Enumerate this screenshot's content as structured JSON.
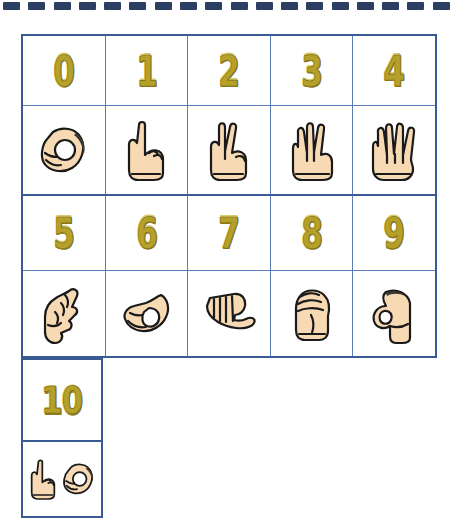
{
  "page": {
    "background_color": "#ffffff"
  },
  "binding": {
    "name": "spiral-binding-dashes",
    "dash_color": "#2c3e62",
    "dash_count": 18
  },
  "colors": {
    "grid_border_outer": "#3a5a94",
    "grid_border_inner": "#5b7cb5",
    "number_fill": "#b5a02a",
    "number_outline": "#7d6d18",
    "skin_fill": "#f7d9b4",
    "skin_outline": "#1a1a1a"
  },
  "chart": {
    "rows": [
      {
        "type": "numbers",
        "cells": [
          {
            "label": "0",
            "name": "number-0"
          },
          {
            "label": "1",
            "name": "number-1"
          },
          {
            "label": "2",
            "name": "number-2"
          },
          {
            "label": "3",
            "name": "number-3"
          },
          {
            "label": "4",
            "name": "number-4"
          }
        ]
      },
      {
        "type": "hands",
        "cells": [
          {
            "sign": "asl-hand-0",
            "alt": "Hand sign for 0 - fingers and thumb form an O"
          },
          {
            "sign": "asl-hand-1",
            "alt": "Hand sign for 1 - index finger up"
          },
          {
            "sign": "asl-hand-2",
            "alt": "Hand sign for 2 - index and middle finger up"
          },
          {
            "sign": "asl-hand-3",
            "alt": "Hand sign for 3 - thumb, index and middle up"
          },
          {
            "sign": "asl-hand-4",
            "alt": "Hand sign for 4 - four fingers up"
          }
        ]
      },
      {
        "type": "numbers",
        "cells": [
          {
            "label": "5",
            "name": "number-5"
          },
          {
            "label": "6",
            "name": "number-6"
          },
          {
            "label": "7",
            "name": "number-7"
          },
          {
            "label": "8",
            "name": "number-8"
          },
          {
            "label": "9",
            "name": "number-9"
          }
        ]
      },
      {
        "type": "hands",
        "cells": [
          {
            "sign": "asl-hand-5",
            "alt": "Hand sign for 5 - pinky touching thumb"
          },
          {
            "sign": "asl-hand-6",
            "alt": "Hand sign for 6 - ring finger touching thumb"
          },
          {
            "sign": "asl-hand-7",
            "alt": "Hand sign for 7 - middle finger touching thumb"
          },
          {
            "sign": "asl-hand-8",
            "alt": "Hand sign for 8 - closed fist"
          },
          {
            "sign": "asl-hand-9",
            "alt": "Hand sign for 9 - index finger curled to thumb"
          }
        ]
      }
    ]
  },
  "ten_block": {
    "number": {
      "label": "10",
      "name": "number-10"
    },
    "hands": [
      {
        "sign": "asl-hand-1",
        "alt": "Hand sign for 1 - index finger up"
      },
      {
        "sign": "asl-hand-0",
        "alt": "Hand sign for 0 - fingers and thumb form an O"
      }
    ]
  }
}
